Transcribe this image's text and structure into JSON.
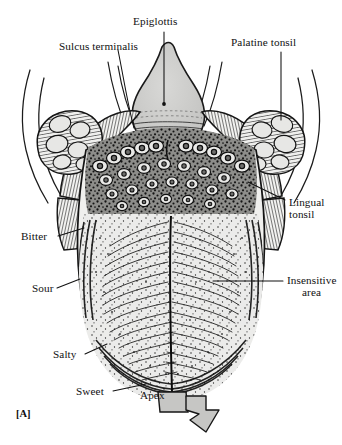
{
  "figure": {
    "panel_id": "[A]",
    "background_color": "#ffffff",
    "ink_color": "#111111",
    "fill_gray": "#c9c9c9"
  },
  "labels": {
    "epiglottis": "Epiglottis",
    "sulcus_terminalis": "Sulcus terminalis",
    "palatine_tonsil": "Palatine tonsil",
    "lingual_tonsil_line1": "Lingual",
    "lingual_tonsil_line2": "tonsil",
    "insensitive_line1": "Insensitive",
    "insensitive_line2": "area",
    "bitter": "Bitter",
    "sour": "Sour",
    "salty": "Salty",
    "sweet": "Sweet",
    "apex": "Apex"
  },
  "structures": {
    "epiglottis": "epiglottis-shape",
    "palatine_tonsil_left": "palatine-tonsil-left",
    "palatine_tonsil_right": "palatine-tonsil-right",
    "lingual_tonsil_follicles": "lingual-tonsil-follicles",
    "circumvallate_papillae": "circumvallate-papillae",
    "median_sulcus": "median-sulcus",
    "tongue_body": "tongue-body",
    "apex_arrow": "apex-direction-arrow"
  }
}
